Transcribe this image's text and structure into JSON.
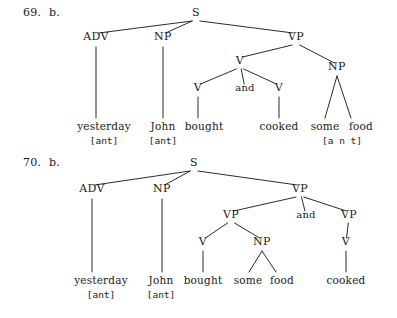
{
  "page": {
    "background_color": "#ffffff",
    "ink_color": "#1b1b1b",
    "width": 397,
    "height": 318
  },
  "figures": [
    {
      "id": "figure-69",
      "number_label": "69.  b.",
      "nodes": [
        {
          "id": "s",
          "text": "S",
          "x": 196,
          "y": 16,
          "kind": "category"
        },
        {
          "id": "adv",
          "text": "ADV",
          "x": 96,
          "y": 40,
          "kind": "category"
        },
        {
          "id": "np1",
          "text": "NP",
          "x": 163,
          "y": 40,
          "kind": "category"
        },
        {
          "id": "vp",
          "text": "VP",
          "x": 296,
          "y": 40,
          "kind": "category"
        },
        {
          "id": "v_top",
          "text": "V",
          "x": 240,
          "y": 64,
          "kind": "category"
        },
        {
          "id": "np2",
          "text": "NP",
          "x": 337,
          "y": 70,
          "kind": "category"
        },
        {
          "id": "v_left",
          "text": "V",
          "x": 198,
          "y": 91,
          "kind": "category"
        },
        {
          "id": "and",
          "text": "and",
          "x": 245,
          "y": 91,
          "kind": "conjunction"
        },
        {
          "id": "v_right",
          "text": "V",
          "x": 279,
          "y": 91,
          "kind": "category"
        }
      ],
      "edges": [
        {
          "from": "s",
          "to": "adv"
        },
        {
          "from": "s",
          "to": "np1"
        },
        {
          "from": "s",
          "to": "vp"
        },
        {
          "from": "vp",
          "to": "v_top"
        },
        {
          "from": "vp",
          "to": "np2"
        },
        {
          "from": "v_top",
          "to": "v_left"
        },
        {
          "from": "v_top",
          "to": "and"
        },
        {
          "from": "v_top",
          "to": "v_right"
        }
      ],
      "leaf_lines": [
        {
          "from": "adv",
          "x1": 96,
          "y1": 47,
          "x2": 96,
          "y2": 118
        },
        {
          "from": "np1",
          "x1": 163,
          "y1": 47,
          "x2": 163,
          "y2": 118
        },
        {
          "from": "v_left",
          "x1": 198,
          "y1": 97,
          "x2": 198,
          "y2": 118
        },
        {
          "from": "v_right",
          "x1": 279,
          "y1": 97,
          "x2": 279,
          "y2": 118
        },
        {
          "from": "np2",
          "x1": 337,
          "y1": 76,
          "x2": 325,
          "y2": 118
        },
        {
          "from": "np2",
          "x1": 337,
          "y1": 76,
          "x2": 351,
          "y2": 118
        }
      ],
      "leaves": [
        {
          "text": "yesterday",
          "x": 104,
          "y": 130
        },
        {
          "text": "John",
          "x": 163,
          "y": 130
        },
        {
          "text": "bought",
          "x": 204,
          "y": 130
        },
        {
          "text": "cooked",
          "x": 279,
          "y": 130
        },
        {
          "text": "some",
          "x": 325,
          "y": 130
        },
        {
          "text": "food",
          "x": 361,
          "y": 130
        }
      ],
      "features": [
        {
          "text": "[ant]",
          "x": 104,
          "y": 144
        },
        {
          "text": "[ant]",
          "x": 163,
          "y": 144
        },
        {
          "text": "[a n t]",
          "x": 342,
          "y": 144
        }
      ]
    },
    {
      "id": "figure-70",
      "number_label": "70.  b.",
      "nodes": [
        {
          "id": "s",
          "text": "S",
          "x": 194,
          "y": 16,
          "kind": "category"
        },
        {
          "id": "adv",
          "text": "ADV",
          "x": 92,
          "y": 42,
          "kind": "category"
        },
        {
          "id": "np1",
          "text": "NP",
          "x": 162,
          "y": 42,
          "kind": "category"
        },
        {
          "id": "vp_top",
          "text": "VP",
          "x": 300,
          "y": 42,
          "kind": "category"
        },
        {
          "id": "vp_left",
          "text": "VP",
          "x": 231,
          "y": 68,
          "kind": "category"
        },
        {
          "id": "and",
          "text": "and",
          "x": 306,
          "y": 68,
          "kind": "conjunction"
        },
        {
          "id": "vp_right",
          "text": "VP",
          "x": 349,
          "y": 68,
          "kind": "category"
        },
        {
          "id": "v_left",
          "text": "V",
          "x": 203,
          "y": 95,
          "kind": "category"
        },
        {
          "id": "np2",
          "text": "NP",
          "x": 262,
          "y": 95,
          "kind": "category"
        },
        {
          "id": "v_right",
          "text": "V",
          "x": 346,
          "y": 95,
          "kind": "category"
        }
      ],
      "edges": [
        {
          "from": "s",
          "to": "adv"
        },
        {
          "from": "s",
          "to": "np1"
        },
        {
          "from": "s",
          "to": "vp_top"
        },
        {
          "from": "vp_top",
          "to": "vp_left"
        },
        {
          "from": "vp_top",
          "to": "and"
        },
        {
          "from": "vp_top",
          "to": "vp_right"
        },
        {
          "from": "vp_left",
          "to": "v_left"
        },
        {
          "from": "vp_left",
          "to": "np2"
        },
        {
          "from": "vp_right",
          "to": "v_right"
        }
      ],
      "leaf_lines": [
        {
          "from": "adv",
          "x1": 92,
          "y1": 49,
          "x2": 92,
          "y2": 122
        },
        {
          "from": "np1",
          "x1": 162,
          "y1": 49,
          "x2": 162,
          "y2": 122
        },
        {
          "from": "v_left",
          "x1": 203,
          "y1": 101,
          "x2": 203,
          "y2": 122
        },
        {
          "from": "v_right",
          "x1": 346,
          "y1": 101,
          "x2": 346,
          "y2": 122
        },
        {
          "from": "np2",
          "x1": 262,
          "y1": 101,
          "x2": 249,
          "y2": 122
        },
        {
          "from": "np2",
          "x1": 262,
          "y1": 101,
          "x2": 276,
          "y2": 122
        }
      ],
      "leaves": [
        {
          "text": "yesterday",
          "x": 101,
          "y": 134
        },
        {
          "text": "John",
          "x": 161,
          "y": 134
        },
        {
          "text": "bought",
          "x": 203,
          "y": 134
        },
        {
          "text": "some",
          "x": 248,
          "y": 134
        },
        {
          "text": "food",
          "x": 282,
          "y": 134
        },
        {
          "text": "cooked",
          "x": 346,
          "y": 134
        }
      ],
      "features": [
        {
          "text": "[ant]",
          "x": 101,
          "y": 148
        },
        {
          "text": "[ant]",
          "x": 161,
          "y": 148
        }
      ]
    }
  ]
}
